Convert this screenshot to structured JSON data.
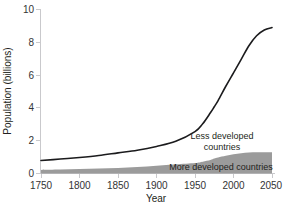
{
  "chart_data": {
    "type": "area",
    "title": "",
    "xlabel": "Year",
    "ylabel": "Population (billions)",
    "xlim": [
      1750,
      2050
    ],
    "ylim": [
      0,
      10
    ],
    "xticks": [
      1750,
      1800,
      1850,
      1900,
      1950,
      2000,
      2050
    ],
    "yticks": [
      0,
      2,
      4,
      6,
      8,
      10
    ],
    "xtick_labels": [
      "1750",
      "1800",
      "1850",
      "1900",
      "1950",
      "2000",
      "2050"
    ],
    "ytick_labels": [
      "0",
      "2",
      "4",
      "6",
      "8",
      "10"
    ],
    "grid": false,
    "legend_position": "inline-annotation",
    "x": [
      1750,
      1775,
      1800,
      1825,
      1850,
      1875,
      1900,
      1925,
      1950,
      1960,
      1970,
      1975,
      1980,
      1990,
      2000,
      2010,
      2020,
      2030,
      2040,
      2050
    ],
    "series": [
      {
        "name": "Total world population (upper boundary curve)",
        "color": "#1b1b1d",
        "values": [
          0.79,
          0.88,
          0.98,
          1.1,
          1.26,
          1.42,
          1.65,
          1.96,
          2.55,
          3.03,
          3.7,
          4.07,
          4.45,
          5.32,
          6.14,
          6.96,
          7.79,
          8.4,
          8.75,
          8.9
        ]
      },
      {
        "name": "More developed countries",
        "color": "#9b9b9b",
        "values": [
          0.22,
          0.24,
          0.27,
          0.3,
          0.34,
          0.4,
          0.48,
          0.56,
          0.64,
          0.72,
          0.82,
          0.91,
          0.98,
          1.08,
          1.17,
          1.24,
          1.28,
          1.3,
          1.3,
          1.3
        ]
      }
    ],
    "annotations": [
      {
        "id": "less-developed",
        "text_line1": "Less developed",
        "text_line2": "countries",
        "x": 1985,
        "y": 2.55
      },
      {
        "id": "more-developed",
        "text": "More developed countries",
        "x": 1998,
        "y": 0.62
      }
    ]
  },
  "axes": {
    "y_title": "Population (billions)",
    "x_title": "Year"
  },
  "colors": {
    "curve": "#1b1b1d",
    "band": "#9b9b9b",
    "axis": "#c9c9cc",
    "text": "#231f20",
    "background": "#ffffff"
  }
}
